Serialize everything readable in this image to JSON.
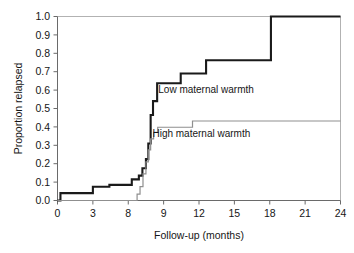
{
  "chart_data": {
    "type": "line",
    "title": "",
    "subtitle": "",
    "xlabel": "Follow-up (months)",
    "ylabel": "Proportion relapsed",
    "xlim": [
      0,
      24
    ],
    "ylim": [
      0,
      1.0
    ],
    "grid": false,
    "legend_position": "inline-annotations",
    "step_style": "post",
    "xticks": [
      0,
      3,
      6,
      9,
      12,
      15,
      18,
      21,
      24
    ],
    "xtick_labels": [
      "0",
      "3",
      "8",
      "9",
      "12",
      "15",
      "18",
      "21",
      "24"
    ],
    "yticks": [
      0.0,
      0.1,
      0.2,
      0.3,
      0.4,
      0.5,
      0.6,
      0.7,
      0.8,
      0.9,
      1.0
    ],
    "ytick_labels": [
      "0.0",
      "0.1",
      "0.2",
      "0.3",
      "0.4",
      "0.5",
      "0.6",
      "0.7",
      "0.8",
      "0.9",
      "1.0"
    ],
    "series": [
      {
        "name": "Low maternal warmth",
        "color": "#1a1a1a",
        "line_width": 2.1,
        "annotation": "Low maternal warmth",
        "annotation_x": 12.6,
        "annotation_y": 0.585,
        "x": [
          0.0,
          0.25,
          0.25,
          3.0,
          3.0,
          4.4,
          4.4,
          6.3,
          6.3,
          6.9,
          6.9,
          7.2,
          7.2,
          7.5,
          7.5,
          7.7,
          7.7,
          7.9,
          7.9,
          8.1,
          8.1,
          8.45,
          8.45,
          10.45,
          10.45,
          12.6,
          12.6,
          18.1,
          18.1,
          24.0
        ],
        "y": [
          0.0,
          0.0,
          0.04,
          0.04,
          0.075,
          0.075,
          0.085,
          0.085,
          0.115,
          0.115,
          0.135,
          0.135,
          0.175,
          0.175,
          0.225,
          0.225,
          0.31,
          0.31,
          0.465,
          0.465,
          0.54,
          0.54,
          0.637,
          0.637,
          0.69,
          0.69,
          0.762,
          0.762,
          1.0,
          1.0
        ]
      },
      {
        "name": "High maternal warmth",
        "color": "#8f8f8f",
        "line_width": 1.2,
        "annotation": "High maternal warmth",
        "annotation_x": 12.2,
        "annotation_y": 0.345,
        "x": [
          0.0,
          6.75,
          6.75,
          7.0,
          7.0,
          7.25,
          7.25,
          7.5,
          7.5,
          7.7,
          7.7,
          7.9,
          7.9,
          8.15,
          8.15,
          8.5,
          8.5,
          11.45,
          11.45,
          24.0
        ],
        "y": [
          0.0,
          0.0,
          0.035,
          0.035,
          0.075,
          0.075,
          0.145,
          0.145,
          0.21,
          0.21,
          0.275,
          0.275,
          0.335,
          0.335,
          0.37,
          0.37,
          0.398,
          0.398,
          0.432,
          0.432
        ]
      }
    ]
  }
}
